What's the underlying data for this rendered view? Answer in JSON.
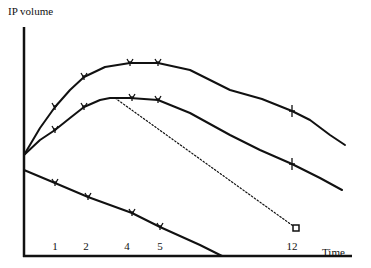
{
  "diagram": {
    "y_axis_label": "IP volume",
    "x_axis_label": "Time",
    "x_ticks": [
      {
        "label": "1",
        "x": 55
      },
      {
        "label": "2",
        "x": 86
      },
      {
        "label": "4",
        "x": 127
      },
      {
        "label": "5",
        "x": 160
      },
      {
        "label": "12",
        "x": 292
      }
    ],
    "curves": [
      {
        "name": "upper-curve",
        "style": "solid",
        "points": [
          [
            24,
            155
          ],
          [
            40,
            128
          ],
          [
            55,
            107
          ],
          [
            70,
            90
          ],
          [
            84,
            77
          ],
          [
            105,
            67
          ],
          [
            130,
            63
          ],
          [
            158,
            63
          ],
          [
            190,
            70
          ],
          [
            230,
            90
          ],
          [
            262,
            99
          ],
          [
            292,
            111
          ],
          [
            310,
            120
          ],
          [
            330,
            135
          ],
          [
            345,
            145
          ]
        ],
        "markers": [
          [
            55,
            107,
            "v"
          ],
          [
            84,
            77,
            "v"
          ],
          [
            130,
            63,
            "v"
          ],
          [
            158,
            63,
            "v"
          ],
          [
            292,
            111,
            "+"
          ]
        ]
      },
      {
        "name": "middle-curve",
        "style": "solid",
        "points": [
          [
            24,
            155
          ],
          [
            40,
            140
          ],
          [
            55,
            130
          ],
          [
            70,
            118
          ],
          [
            84,
            107
          ],
          [
            100,
            100
          ],
          [
            110,
            98
          ],
          [
            130,
            98
          ],
          [
            158,
            100
          ],
          [
            190,
            113
          ],
          [
            230,
            135
          ],
          [
            260,
            150
          ],
          [
            292,
            164
          ],
          [
            320,
            178
          ],
          [
            342,
            190
          ]
        ],
        "markers": [
          [
            55,
            130,
            "v"
          ],
          [
            84,
            107,
            "v"
          ],
          [
            132,
            98,
            "v"
          ],
          [
            158,
            100,
            "v"
          ],
          [
            292,
            164,
            "+"
          ]
        ]
      },
      {
        "name": "lower-curve",
        "style": "solid",
        "points": [
          [
            24,
            170
          ],
          [
            55,
            183
          ],
          [
            88,
            197
          ],
          [
            110,
            205
          ],
          [
            132,
            213
          ],
          [
            160,
            227
          ],
          [
            180,
            236
          ],
          [
            200,
            245
          ],
          [
            222,
            256
          ]
        ],
        "markers": [
          [
            55,
            183,
            "v"
          ],
          [
            88,
            197,
            "v"
          ],
          [
            132,
            213,
            "v"
          ],
          [
            160,
            227,
            "v"
          ]
        ]
      },
      {
        "name": "dotted-projection",
        "style": "dotted",
        "points": [
          [
            115,
            98
          ],
          [
            296,
            228
          ]
        ],
        "markers": [
          [
            296,
            228,
            "square"
          ]
        ]
      }
    ],
    "colors": {
      "line": "#111111",
      "background": "#ffffff"
    }
  }
}
